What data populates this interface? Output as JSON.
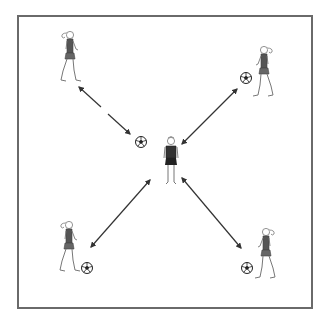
{
  "diagram": {
    "type": "soccer passing drill",
    "field": {
      "shape": "square",
      "border_color": "#6a6a6a"
    },
    "players": [
      {
        "id": "top-left",
        "role": "outside player",
        "x": 68,
        "y": 55,
        "facing": "right"
      },
      {
        "id": "top-right",
        "role": "outside player",
        "x": 266,
        "y": 70,
        "facing": "left",
        "has_ball": true
      },
      {
        "id": "bottom-left",
        "role": "outside player",
        "x": 67,
        "y": 245,
        "facing": "right",
        "has_ball": true
      },
      {
        "id": "bottom-right",
        "role": "outside player",
        "x": 268,
        "y": 252,
        "facing": "left",
        "has_ball": true
      },
      {
        "id": "center",
        "role": "central player",
        "x": 171,
        "y": 162,
        "facing": "front"
      }
    ],
    "balls": [
      {
        "id": "ball-center-left",
        "x": 141,
        "y": 142
      },
      {
        "id": "ball-top-right",
        "x": 246,
        "y": 78
      },
      {
        "id": "ball-bottom-left",
        "x": 87,
        "y": 268
      },
      {
        "id": "ball-bottom-right",
        "x": 247,
        "y": 268
      }
    ],
    "arrows": [
      {
        "id": "arrow-top-left",
        "x1": 79,
        "y1": 87,
        "x2": 130,
        "y2": 134,
        "style": "double-headed, broken"
      },
      {
        "id": "arrow-top-right",
        "x1": 237,
        "y1": 89,
        "x2": 182,
        "y2": 144,
        "style": "double-headed"
      },
      {
        "id": "arrow-bottom-left",
        "x1": 91,
        "y1": 247,
        "x2": 150,
        "y2": 180,
        "style": "double-headed"
      },
      {
        "id": "arrow-bottom-right",
        "x1": 182,
        "y1": 178,
        "x2": 241,
        "y2": 248,
        "style": "double-headed"
      }
    ],
    "colors": {
      "line": "#333333",
      "player_fill": "#555555",
      "outline": "#777777"
    }
  }
}
